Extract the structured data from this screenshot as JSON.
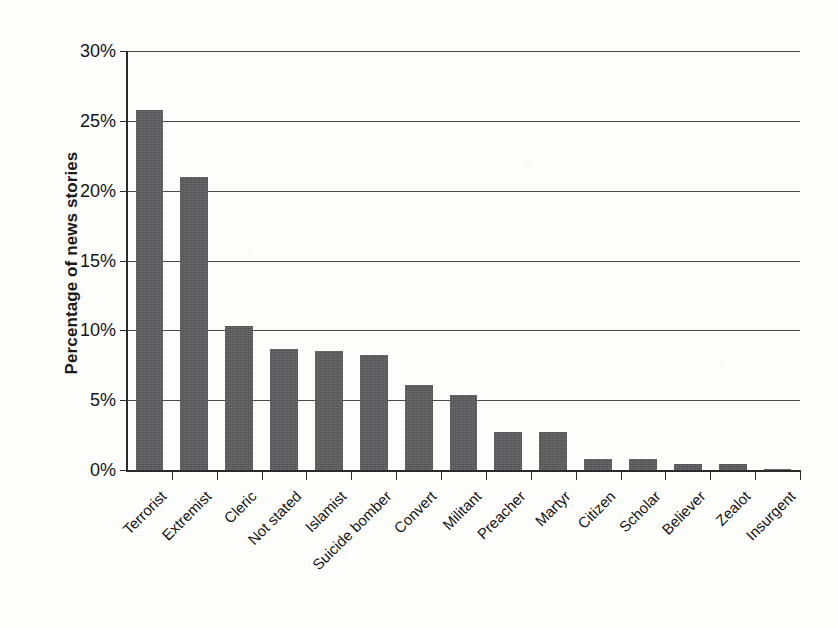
{
  "chart_data": {
    "type": "bar",
    "title": "",
    "xlabel": "",
    "ylabel": "Percentage of news stories",
    "ylim": [
      0,
      30
    ],
    "ytick_labels": [
      "0%",
      "5%",
      "10%",
      "15%",
      "20%",
      "25%",
      "30%"
    ],
    "ytick_values": [
      0,
      5,
      10,
      15,
      20,
      25,
      30
    ],
    "grid": true,
    "legend": "none",
    "bar_color": "#59595b",
    "categories": [
      "Terrorist",
      "Extremist",
      "Cleric",
      "Not stated",
      "Islamist",
      "Suicide bomber",
      "Convert",
      "Militant",
      "Preacher",
      "Martyr",
      "Citizen",
      "Scholar",
      "Believer",
      "Zealot",
      "Insurgent"
    ],
    "values": [
      25.8,
      21.0,
      10.3,
      8.7,
      8.5,
      8.2,
      6.1,
      5.4,
      2.7,
      2.7,
      0.8,
      0.8,
      0.4,
      0.4,
      0.1
    ],
    "value_unit": "%"
  }
}
